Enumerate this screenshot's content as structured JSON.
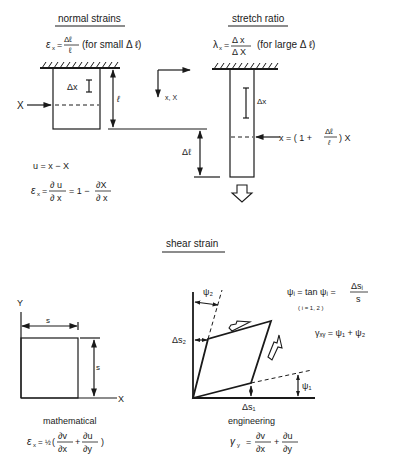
{
  "sections": {
    "normal_strains": {
      "title": "normal strains",
      "formula_lhs": "ε",
      "formula_sub": "x",
      "formula_num": "Δℓ",
      "formula_den": "ℓ",
      "formula_note": "(for small Δ ℓ)",
      "label_X": "X",
      "label_dx": "Δx",
      "label_l": "ℓ",
      "eq1": "u = x − X",
      "eq2_lhs": "ε",
      "eq2_sub": "x",
      "eq2_num1": "∂ u",
      "eq2_den1": "∂ x",
      "eq2_mid": "=  1 −",
      "eq2_num2": "∂X",
      "eq2_den2": "∂ x"
    },
    "axes": {
      "label": "x, X"
    },
    "stretch_ratio": {
      "title": "stretch ratio",
      "formula_lhs": "λ",
      "formula_sub": "x",
      "formula_num": "Δ x",
      "formula_den": "Δ X",
      "formula_note": "(for large Δ ℓ)",
      "label_dx": "Δx",
      "label_dl": "Δℓ",
      "eq_lhs": "x = ( 1 +",
      "eq_num": "Δℓ",
      "eq_den": "ℓ",
      "eq_rhs": ") X"
    },
    "shear_strain": {
      "title": "shear strain",
      "math": {
        "label_Y": "Y",
        "label_X": "X",
        "label_s_top": "s",
        "label_s_side": "s",
        "caption": "mathematical",
        "formula_lhs": "ε",
        "formula_sub": "x",
        "formula_half": "½",
        "formula_num1": "∂v",
        "formula_den1": "∂x",
        "formula_num2": "∂u",
        "formula_den2": "∂y"
      },
      "eng": {
        "label_psi2": "ψ₂",
        "label_psi1": "ψ₁",
        "label_ds2": "Δs₂",
        "label_ds1": "Δs₁",
        "caption": "engineering",
        "formula_lhs": "γ",
        "formula_sub": "y",
        "formula_num1": "∂v",
        "formula_den1": "∂x",
        "formula_num2": "∂u",
        "formula_den2": "∂y",
        "def_lhs": "ψᵢ  =  tan ψᵢ =",
        "def_num": "Δsᵢ",
        "def_den": "s",
        "def_range": "( i = 1, 2 )",
        "gamma_def": "γₓᵧ = ψ₁  + ψ₂"
      }
    }
  }
}
